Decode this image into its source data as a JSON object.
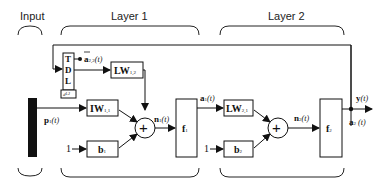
{
  "headers": {
    "input": "Input",
    "layer1": "Layer 1",
    "layer2": "Layer 2"
  },
  "blocks": {
    "tdl": {
      "letters": [
        "T",
        "D",
        "L"
      ],
      "delay": "d¹·²"
    },
    "lw12": {
      "main": "LW",
      "sub": "1,2"
    },
    "iw11": {
      "main": "IW",
      "sub": "1,1"
    },
    "b1": {
      "main": "b",
      "sub": "1"
    },
    "f1": {
      "main": "f",
      "sub": "1"
    },
    "lw21": {
      "main": "LW",
      "sub": "2,1"
    },
    "b2": {
      "main": "b",
      "sub": "2"
    },
    "f2": {
      "main": "f",
      "sub": "2"
    }
  },
  "signals": {
    "a22": {
      "main": "a",
      "sup": "2,2",
      "arg": "(t)"
    },
    "p1": {
      "main": "p",
      "sup": "1",
      "arg": "(t)"
    },
    "n1": {
      "main": "n",
      "sup": "1",
      "arg": "(t)"
    },
    "a1": {
      "main": "a",
      "sup": "1",
      "arg": "(t)"
    },
    "n2": {
      "main": "n",
      "sup": "2",
      "arg": "(t)"
    },
    "y": {
      "main": "y",
      "arg": "(t)"
    },
    "a2": {
      "main": "a",
      "sup": "2",
      "arg": " (t)"
    }
  },
  "constants": {
    "one_b1": "1",
    "one_b2": "1"
  },
  "summation_symbol": "+"
}
